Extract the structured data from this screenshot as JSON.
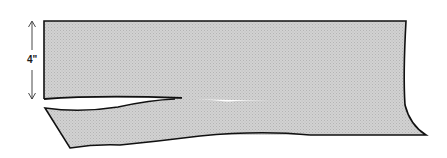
{
  "diagram": {
    "dimension_label": "4\"",
    "colors": {
      "fill": "#c8c8c8",
      "outline": "#111111",
      "background": "#ffffff"
    }
  }
}
